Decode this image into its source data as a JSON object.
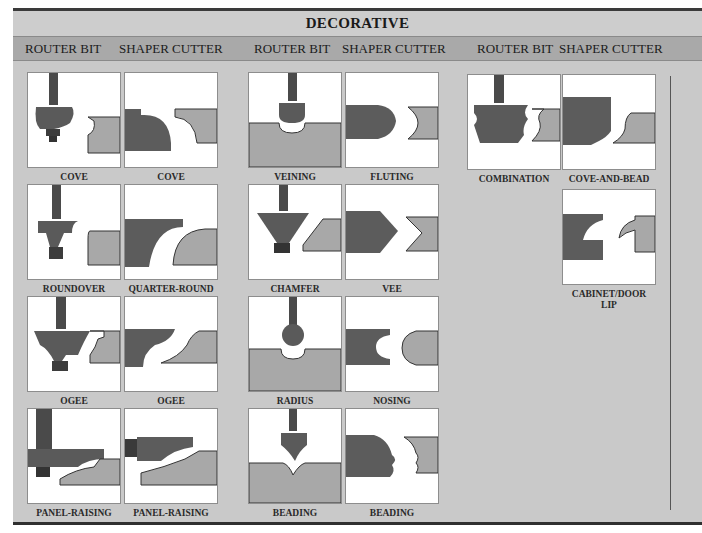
{
  "title": "DECORATIVE",
  "column_headers": [
    "ROUTER BIT",
    "SHAPER CUTTER",
    "ROUTER BIT",
    "SHAPER CUTTER",
    "ROUTER BIT",
    "SHAPER CUTTER"
  ],
  "groups": [
    {
      "rows": [
        {
          "router": {
            "label": "COVE",
            "icon": "cove-router-bit-icon"
          },
          "shaper": {
            "label": "COVE",
            "icon": "cove-shaper-cutter-icon"
          }
        },
        {
          "router": {
            "label": "ROUNDOVER",
            "icon": "roundover-router-bit-icon"
          },
          "shaper": {
            "label": "QUARTER-ROUND",
            "icon": "quarter-round-shaper-cutter-icon"
          }
        },
        {
          "router": {
            "label": "OGEE",
            "icon": "ogee-router-bit-icon"
          },
          "shaper": {
            "label": "OGEE",
            "icon": "ogee-shaper-cutter-icon"
          }
        },
        {
          "router": {
            "label": "PANEL-RAISING",
            "icon": "panel-raising-router-bit-icon"
          },
          "shaper": {
            "label": "PANEL-RAISING",
            "icon": "panel-raising-shaper-cutter-icon"
          }
        }
      ]
    },
    {
      "rows": [
        {
          "router": {
            "label": "VEINING",
            "icon": "veining-router-bit-icon"
          },
          "shaper": {
            "label": "FLUTING",
            "icon": "fluting-shaper-cutter-icon"
          }
        },
        {
          "router": {
            "label": "CHAMFER",
            "icon": "chamfer-router-bit-icon"
          },
          "shaper": {
            "label": "VEE",
            "icon": "vee-shaper-cutter-icon"
          }
        },
        {
          "router": {
            "label": "RADIUS",
            "icon": "radius-router-bit-icon"
          },
          "shaper": {
            "label": "NOSING",
            "icon": "nosing-shaper-cutter-icon"
          }
        },
        {
          "router": {
            "label": "BEADING",
            "icon": "beading-router-bit-icon"
          },
          "shaper": {
            "label": "BEADING",
            "icon": "beading-shaper-cutter-icon"
          }
        }
      ]
    },
    {
      "rows": [
        {
          "router": {
            "label": "COMBINATION",
            "icon": "combination-router-bit-icon"
          },
          "shaper": {
            "label": "COVE-AND-BEAD",
            "icon": "cove-and-bead-shaper-cutter-icon"
          }
        },
        {
          "shaper": {
            "label": "CABINET/DOOR",
            "label2": "LIP",
            "icon": "cabinet-door-lip-shaper-cutter-icon"
          }
        }
      ]
    }
  ],
  "colors": {
    "background": "#c9c9c9",
    "header_band": "#a9a9a9",
    "bit_dark": "#555555",
    "stock": "#a8a8a8",
    "border": "#2f2f2f"
  }
}
